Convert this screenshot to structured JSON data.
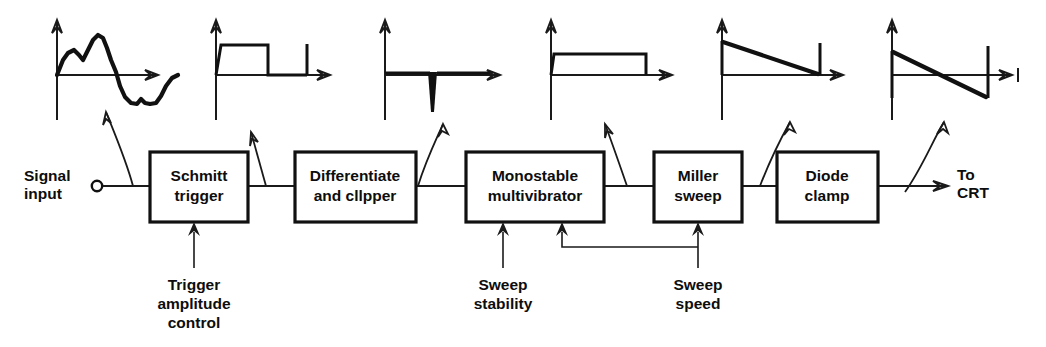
{
  "figure": {
    "type": "block-diagram"
  },
  "io": {
    "input_label_line1": "Signal",
    "input_label_line2": "input",
    "input_terminal": "open-circle-terminal",
    "output_label_line1": "To",
    "output_label_line2": "CRT"
  },
  "blocks": [
    {
      "id": "schmitt",
      "line1": "Schmitt",
      "line2": "trigger"
    },
    {
      "id": "differ",
      "line1": "Differentiate",
      "line2": "and cllpper"
    },
    {
      "id": "monostable",
      "line1": "Monostable",
      "line2": "multivibrator"
    },
    {
      "id": "miller",
      "line1": "Miller",
      "line2": "sweep"
    },
    {
      "id": "diode",
      "line1": "Diode",
      "line2": "clamp"
    }
  ],
  "controls": [
    {
      "id": "trigger-amplitude",
      "line1": "Trigger",
      "line2": "amplitude",
      "line3": "control",
      "target": "schmitt"
    },
    {
      "id": "sweep-stability",
      "line1": "Sweep",
      "line2": "stability",
      "line3": "",
      "target": "monostable"
    },
    {
      "id": "sweep-speed",
      "line1": "Sweep",
      "line2": "speed",
      "line3": "",
      "target": "miller + monostable"
    }
  ],
  "waveforms": [
    {
      "id": "wf-input",
      "name": "complex-analog-input-waveform",
      "after": "signal input"
    },
    {
      "id": "wf-squared",
      "name": "square-pulse-with-spike",
      "after": "Schmitt trigger"
    },
    {
      "id": "wf-spike",
      "name": "negative-differentiated-spike",
      "after": "Differentiate and clipper"
    },
    {
      "id": "wf-gate",
      "name": "rectangular-gate-pulse",
      "after": "Monostable multivibrator"
    },
    {
      "id": "wf-ramp",
      "name": "sawtooth-ramp-above-axis",
      "after": "Miller sweep"
    },
    {
      "id": "wf-clamped-ramp",
      "name": "clamped-sawtooth-about-zero",
      "after": "Diode clamp"
    }
  ],
  "colors": {
    "ink": "#111111",
    "background": "#ffffff"
  }
}
